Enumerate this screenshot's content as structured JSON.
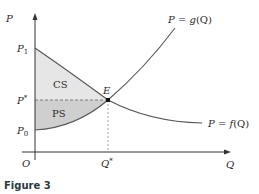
{
  "figure": {
    "caption": "Figure 3",
    "axes": {
      "y_label": "P",
      "x_label": "Q",
      "origin_label": "O"
    },
    "price_labels": {
      "p1": {
        "main": "P",
        "sub": "1"
      },
      "p_star": {
        "main": "P",
        "sup": "*"
      },
      "p0": {
        "main": "P",
        "sub": "0"
      }
    },
    "quantity_labels": {
      "q_star": {
        "main": "Q",
        "sup": "*"
      }
    },
    "curves": {
      "supply": {
        "label_lhs": "P",
        "label_eq": " = ",
        "label_fn": "g",
        "label_arg": "(Q)"
      },
      "demand": {
        "label_lhs": "P",
        "label_eq": " = ",
        "label_fn": "f",
        "label_arg": "(Q)"
      }
    },
    "equilibrium_label": "E",
    "regions": {
      "consumer_surplus": "CS",
      "producer_surplus": "PS"
    },
    "colors": {
      "axis": "#333333",
      "curve": "#555555",
      "cs_fill": "#e6e6e6",
      "ps_fill": "#cfcfcf",
      "dashed": "#666666"
    }
  }
}
